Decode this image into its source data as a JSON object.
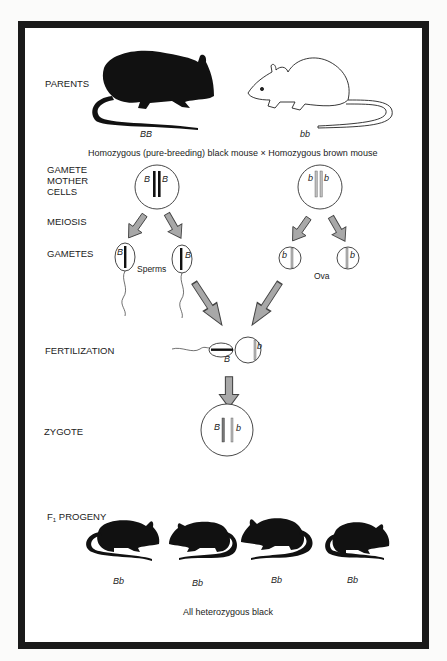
{
  "stages": {
    "parents": "PARENTS",
    "gamete_mother_cells": [
      "GAMETE",
      "MOTHER",
      "CELLS"
    ],
    "meiosis": "MEIOSIS",
    "gametes": "GAMETES",
    "fertilization": "FERTILIZATION",
    "zygote": "ZYGOTE",
    "f1_progeny_prefix": "F",
    "f1_progeny_sub": "1",
    "f1_progeny_suffix": " PROGENY"
  },
  "parents": {
    "black": {
      "genotype": "BB",
      "color": "#111111"
    },
    "brown": {
      "genotype": "bb",
      "color": "#ffffff"
    },
    "cross_caption": "Homozygous (pure-breeding) black mouse × Homozygous brown mouse"
  },
  "mother_cells": {
    "male": {
      "alleles": [
        "B",
        "B"
      ]
    },
    "female": {
      "alleles": [
        "b",
        "b"
      ]
    }
  },
  "gametes": {
    "sperms_label": "Sperms",
    "ova_label": "Ova",
    "sperm_alleles": [
      "B",
      "B"
    ],
    "ova_alleles": [
      "b",
      "b"
    ]
  },
  "fertilization": {
    "sperm_allele": "B",
    "ovum_allele": "b"
  },
  "zygote": {
    "alleles": [
      "B",
      "b"
    ]
  },
  "progeny": {
    "genotypes": [
      "Bb",
      "Bb",
      "Bb",
      "Bb"
    ],
    "caption": "All heterozygous black"
  },
  "colors": {
    "frame": "#1a1a1a",
    "arrow_fill": "#a8a8a8",
    "arrow_stroke": "#444444",
    "chromosome_light": "#bdbdbd"
  }
}
